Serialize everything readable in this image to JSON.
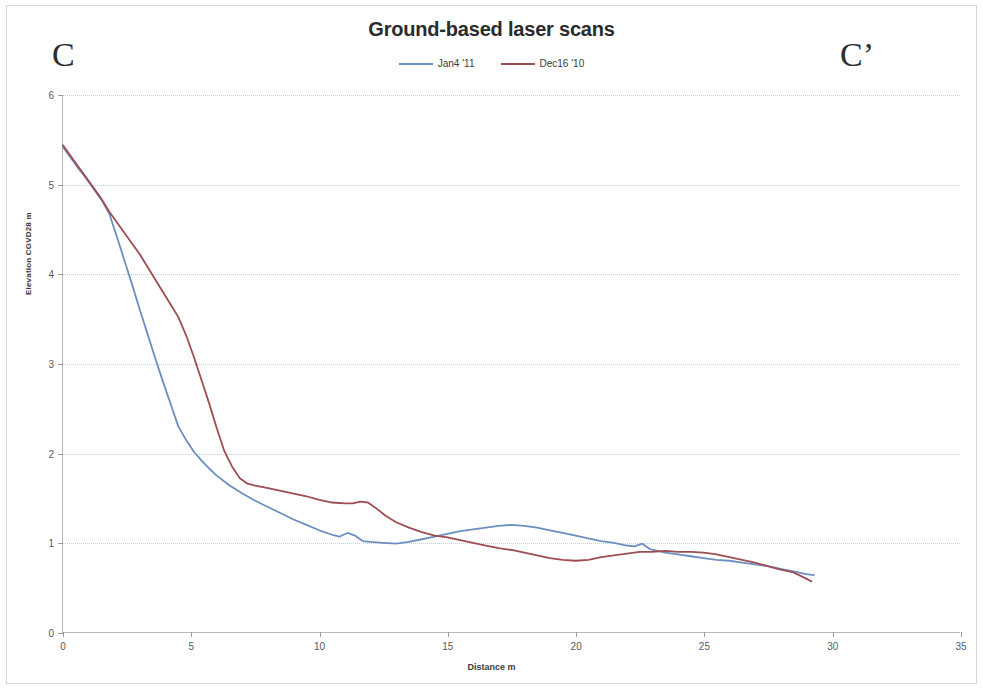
{
  "chart_data": {
    "type": "line",
    "title": "Ground-based laser scans",
    "xlabel": "Distance  m",
    "ylabel": "Elevation  CGVD28 m",
    "xlim": [
      0,
      35
    ],
    "ylim": [
      0,
      6
    ],
    "xticks": [
      0,
      5,
      10,
      15,
      20,
      25,
      30,
      35
    ],
    "yticks": [
      0,
      1,
      2,
      3,
      4,
      5,
      6
    ],
    "grid": "horizontal",
    "legend_position": "top-center",
    "annotations": [
      {
        "name": "section-start",
        "text": "C"
      },
      {
        "name": "section-end",
        "text": "C’"
      }
    ],
    "series": [
      {
        "name": "Jan4 '11",
        "color": "#6b8fc0",
        "points": [
          [
            0.0,
            5.42
          ],
          [
            0.3,
            5.3
          ],
          [
            0.6,
            5.18
          ],
          [
            0.9,
            5.07
          ],
          [
            1.2,
            4.95
          ],
          [
            1.5,
            4.83
          ],
          [
            1.8,
            4.68
          ],
          [
            2.1,
            4.42
          ],
          [
            2.4,
            4.15
          ],
          [
            2.7,
            3.88
          ],
          [
            3.0,
            3.6
          ],
          [
            3.3,
            3.33
          ],
          [
            3.6,
            3.06
          ],
          [
            3.9,
            2.8
          ],
          [
            4.2,
            2.55
          ],
          [
            4.5,
            2.3
          ],
          [
            4.8,
            2.15
          ],
          [
            5.1,
            2.02
          ],
          [
            5.4,
            1.92
          ],
          [
            5.7,
            1.83
          ],
          [
            6.0,
            1.75
          ],
          [
            6.5,
            1.64
          ],
          [
            7.0,
            1.55
          ],
          [
            7.5,
            1.47
          ],
          [
            8.0,
            1.4
          ],
          [
            8.5,
            1.33
          ],
          [
            9.0,
            1.26
          ],
          [
            9.5,
            1.2
          ],
          [
            10.0,
            1.14
          ],
          [
            10.5,
            1.09
          ],
          [
            10.8,
            1.07
          ],
          [
            11.1,
            1.11
          ],
          [
            11.4,
            1.08
          ],
          [
            11.7,
            1.02
          ],
          [
            12.0,
            1.01
          ],
          [
            12.5,
            1.0
          ],
          [
            13.0,
            0.99
          ],
          [
            13.5,
            1.01
          ],
          [
            14.0,
            1.04
          ],
          [
            14.5,
            1.07
          ],
          [
            15.0,
            1.1
          ],
          [
            15.5,
            1.13
          ],
          [
            16.0,
            1.15
          ],
          [
            16.5,
            1.17
          ],
          [
            17.0,
            1.19
          ],
          [
            17.5,
            1.2
          ],
          [
            18.0,
            1.19
          ],
          [
            18.5,
            1.17
          ],
          [
            19.0,
            1.14
          ],
          [
            19.5,
            1.11
          ],
          [
            20.0,
            1.08
          ],
          [
            20.5,
            1.05
          ],
          [
            21.0,
            1.02
          ],
          [
            21.5,
            1.0
          ],
          [
            22.0,
            0.97
          ],
          [
            22.3,
            0.96
          ],
          [
            22.6,
            0.99
          ],
          [
            22.9,
            0.93
          ],
          [
            23.5,
            0.89
          ],
          [
            24.0,
            0.87
          ],
          [
            24.5,
            0.85
          ],
          [
            25.0,
            0.83
          ],
          [
            25.5,
            0.81
          ],
          [
            26.0,
            0.8
          ],
          [
            26.5,
            0.78
          ],
          [
            27.0,
            0.76
          ],
          [
            27.5,
            0.74
          ],
          [
            28.0,
            0.71
          ],
          [
            28.5,
            0.68
          ],
          [
            29.0,
            0.65
          ],
          [
            29.3,
            0.64
          ]
        ]
      },
      {
        "name": "Dec16 '10",
        "color": "#9e4d52",
        "points": [
          [
            0.0,
            5.44
          ],
          [
            0.3,
            5.32
          ],
          [
            0.6,
            5.2
          ],
          [
            0.9,
            5.08
          ],
          [
            1.2,
            4.96
          ],
          [
            1.5,
            4.84
          ],
          [
            1.8,
            4.7
          ],
          [
            2.1,
            4.58
          ],
          [
            2.4,
            4.46
          ],
          [
            2.7,
            4.34
          ],
          [
            3.0,
            4.22
          ],
          [
            3.3,
            4.08
          ],
          [
            3.6,
            3.94
          ],
          [
            3.9,
            3.8
          ],
          [
            4.2,
            3.66
          ],
          [
            4.5,
            3.52
          ],
          [
            4.8,
            3.32
          ],
          [
            5.1,
            3.08
          ],
          [
            5.4,
            2.82
          ],
          [
            5.7,
            2.56
          ],
          [
            6.0,
            2.28
          ],
          [
            6.3,
            2.02
          ],
          [
            6.6,
            1.85
          ],
          [
            6.9,
            1.72
          ],
          [
            7.2,
            1.66
          ],
          [
            7.5,
            1.64
          ],
          [
            8.0,
            1.61
          ],
          [
            8.5,
            1.58
          ],
          [
            9.0,
            1.55
          ],
          [
            9.5,
            1.52
          ],
          [
            10.0,
            1.48
          ],
          [
            10.5,
            1.45
          ],
          [
            11.0,
            1.44
          ],
          [
            11.3,
            1.44
          ],
          [
            11.6,
            1.46
          ],
          [
            11.9,
            1.45
          ],
          [
            12.2,
            1.39
          ],
          [
            12.6,
            1.3
          ],
          [
            13.0,
            1.23
          ],
          [
            13.5,
            1.17
          ],
          [
            14.0,
            1.12
          ],
          [
            14.5,
            1.08
          ],
          [
            15.0,
            1.06
          ],
          [
            15.5,
            1.03
          ],
          [
            16.0,
            1.0
          ],
          [
            16.5,
            0.97
          ],
          [
            17.0,
            0.94
          ],
          [
            17.5,
            0.92
          ],
          [
            18.0,
            0.89
          ],
          [
            18.5,
            0.86
          ],
          [
            19.0,
            0.83
          ],
          [
            19.5,
            0.81
          ],
          [
            20.0,
            0.8
          ],
          [
            20.5,
            0.81
          ],
          [
            21.0,
            0.84
          ],
          [
            21.5,
            0.86
          ],
          [
            22.0,
            0.88
          ],
          [
            22.5,
            0.9
          ],
          [
            23.0,
            0.9
          ],
          [
            23.5,
            0.91
          ],
          [
            24.0,
            0.9
          ],
          [
            24.5,
            0.9
          ],
          [
            25.0,
            0.89
          ],
          [
            25.5,
            0.87
          ],
          [
            26.0,
            0.84
          ],
          [
            26.5,
            0.81
          ],
          [
            27.0,
            0.78
          ],
          [
            27.5,
            0.74
          ],
          [
            28.0,
            0.7
          ],
          [
            28.5,
            0.67
          ],
          [
            29.0,
            0.6
          ],
          [
            29.2,
            0.57
          ]
        ]
      }
    ]
  }
}
